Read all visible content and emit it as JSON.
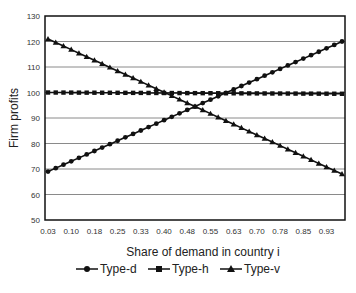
{
  "chart_data": {
    "type": "line",
    "title": "",
    "xlabel": "Share of demand in country i",
    "ylabel": "Firm profits",
    "ylim": [
      50,
      130
    ],
    "yticks": [
      50,
      60,
      70,
      80,
      90,
      100,
      110,
      120,
      130
    ],
    "xtick_labels": [
      "0.03",
      "0.10",
      "0.18",
      "0.25",
      "0.33",
      "0.40",
      "0.48",
      "0.55",
      "0.63",
      "0.70",
      "0.78",
      "0.85",
      "0.93"
    ],
    "x": [
      0.03,
      0.055,
      0.08,
      0.105,
      0.13,
      0.155,
      0.18,
      0.205,
      0.23,
      0.255,
      0.28,
      0.305,
      0.33,
      0.355,
      0.38,
      0.405,
      0.43,
      0.455,
      0.48,
      0.505,
      0.53,
      0.555,
      0.58,
      0.605,
      0.63,
      0.655,
      0.68,
      0.705,
      0.73,
      0.755,
      0.78,
      0.805,
      0.83,
      0.855,
      0.88,
      0.905,
      0.93,
      0.955,
      0.98
    ],
    "grid": true,
    "legend_position": "bottom",
    "series": [
      {
        "name": "Type-d",
        "marker": "circle",
        "start": 69,
        "end": 120
      },
      {
        "name": "Type-h",
        "marker": "square",
        "start": 100,
        "end": 99.5
      },
      {
        "name": "Type-v",
        "marker": "triangle",
        "start": 121,
        "end": 68
      }
    ]
  },
  "legend": {
    "items": [
      "Type-d",
      "Type-h",
      "Type-v"
    ]
  }
}
